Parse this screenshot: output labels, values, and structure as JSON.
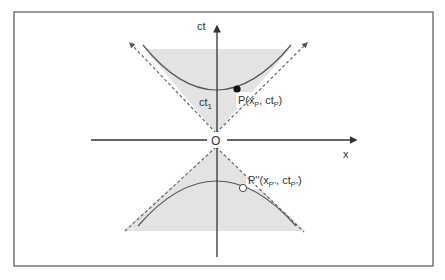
{
  "diagram": {
    "axes": {
      "vertical_label": "ct",
      "horizontal_label": "x",
      "origin_label": "O"
    },
    "points": {
      "p": {
        "label": "P(x",
        "sub1": "P",
        "mid": ", ct",
        "sub2": "P",
        "end": ")"
      },
      "p2": {
        "label": "P''(x",
        "sub1": "P''",
        "mid": ", ct",
        "sub2": "P''",
        "end": ")"
      },
      "ct1": {
        "label": "ct",
        "sub": "1"
      }
    },
    "colors": {
      "frame": "#555555",
      "fill": "#e3e3e3",
      "axis": "#333333",
      "curve": "#555555",
      "dashed": "#666666"
    }
  }
}
